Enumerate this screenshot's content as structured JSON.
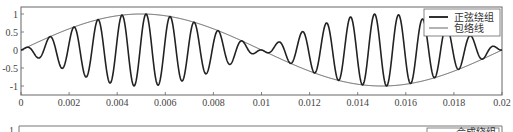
{
  "chart_data": {
    "type": "line",
    "title": "",
    "xlabel": "",
    "ylabel": "",
    "xlim": [
      0,
      0.02
    ],
    "ylim": [
      -1.2,
      1.2
    ],
    "grid": false,
    "legend_position": "upper right",
    "x_ticks": [
      "0",
      "0.002",
      "0.004",
      "0.006",
      "0.008",
      "0.01",
      "0.012",
      "0.014",
      "0.016",
      "0.018",
      "0.02"
    ],
    "x_tick_values": [
      0,
      0.002,
      0.004,
      0.006,
      0.008,
      0.01,
      0.012,
      0.014,
      0.016,
      0.018,
      0.02
    ],
    "y_ticks": [
      "1",
      "0.5",
      "0",
      "-0.5",
      "-1"
    ],
    "y_tick_values": [
      1,
      0.5,
      0,
      -0.5,
      -1
    ],
    "series": [
      {
        "name": "正弦绕组",
        "style": "thick",
        "color": "#222222",
        "description": "amplitude-modulated carrier ≈ sin(2π·50t)·cos(2π·1000(t−0.0002))",
        "carrier_hz": 1000,
        "envelope_hz": 50,
        "phase_shift_s": 0.0002,
        "x": [
          0,
          0.0002,
          0.0007,
          0.0012,
          0.0017,
          0.0022,
          0.0027,
          0.0032,
          0.0037,
          0.0042,
          0.0047,
          0.0052,
          0.0057,
          0.0062,
          0.0067,
          0.0072,
          0.0077,
          0.0082,
          0.0087,
          0.0092,
          0.0097,
          0.0102,
          0.0107,
          0.0112,
          0.0117,
          0.0122,
          0.0127,
          0.0132,
          0.0137,
          0.0142,
          0.0147,
          0.0152,
          0.0157,
          0.0162,
          0.0167,
          0.0172,
          0.0177,
          0.0182,
          0.0187,
          0.0192,
          0.0197,
          0.02
        ],
        "values": [
          0.06,
          0.06,
          -0.22,
          0.37,
          -0.5,
          0.64,
          -0.75,
          0.85,
          -0.93,
          0.98,
          -1.0,
          1.0,
          -0.97,
          0.93,
          -0.86,
          0.77,
          -0.66,
          0.54,
          -0.4,
          0.25,
          -0.09,
          -0.06,
          0.22,
          -0.37,
          0.52,
          -0.64,
          0.75,
          -0.85,
          0.93,
          -0.98,
          1.0,
          -1.0,
          0.97,
          -0.93,
          0.86,
          -0.77,
          0.66,
          -0.54,
          0.4,
          -0.25,
          0.09,
          0.0
        ]
      },
      {
        "name": "包络线",
        "style": "thin",
        "color": "#444444",
        "description": "envelope = sin(2π·50t)",
        "x": [
          0,
          0.002,
          0.004,
          0.005,
          0.006,
          0.008,
          0.01,
          0.012,
          0.014,
          0.015,
          0.016,
          0.018,
          0.02
        ],
        "values": [
          0,
          0.59,
          0.95,
          1.0,
          0.95,
          0.59,
          0,
          -0.59,
          -0.95,
          -1.0,
          -0.95,
          -0.59,
          0
        ]
      }
    ]
  },
  "legend": {
    "items": [
      {
        "label": "正弦绕组"
      },
      {
        "label": "包络线"
      }
    ]
  },
  "lower_panel": {
    "y_tick_partial": "1",
    "legend_partial_label": "合成绕组"
  }
}
